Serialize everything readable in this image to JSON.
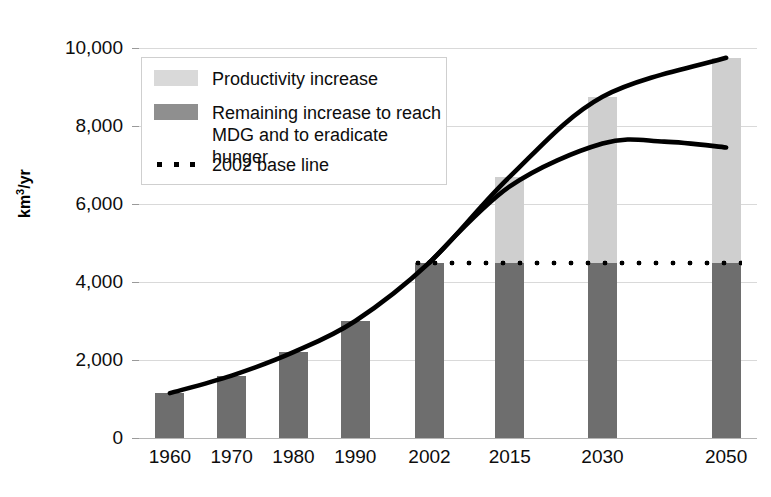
{
  "chart_data": {
    "type": "bar",
    "title": "",
    "subtitle": "",
    "xlabel": "",
    "ylabel": "km3/yr",
    "ylabel_display": "km",
    "ylabel_sup": "3",
    "ylabel_tail": "/yr",
    "categories": [
      "1960",
      "1970",
      "1980",
      "1990",
      "2002",
      "2015",
      "2030",
      "2050"
    ],
    "x_positions": [
      1960,
      1970,
      1980,
      1990,
      2002,
      2015,
      2030,
      2050
    ],
    "ylim": [
      0,
      10000
    ],
    "ytick_values": [
      0,
      2000,
      4000,
      6000,
      8000,
      10000
    ],
    "ytick_labels": [
      "0",
      "2,000",
      "4,000",
      "6,000",
      "8,000",
      "10,000"
    ],
    "grid": true,
    "legend_position": "top-left",
    "stacked": true,
    "series": [
      {
        "name": "Remaining increase to reach MDG and to eradicate hunger",
        "color": "#6e6e6e",
        "values": [
          1150,
          1600,
          2200,
          3000,
          4500,
          4500,
          4500,
          4500
        ]
      },
      {
        "name": "Productivity increase",
        "color": "#cfcfcf",
        "values": [
          0,
          0,
          0,
          0,
          0,
          2200,
          4250,
          5250
        ]
      }
    ],
    "bar_totals": [
      1150,
      1600,
      2200,
      3000,
      4500,
      6700,
      8750,
      9750
    ],
    "reference_line": {
      "name": "2002 base line",
      "value": 4500,
      "style": "dotted",
      "color": "#000000",
      "x_start": 2002,
      "x_end": 2050
    },
    "curves": [
      {
        "name": "upper-trend-curve",
        "color": "#000000",
        "points": [
          [
            1960,
            1150
          ],
          [
            1970,
            1600
          ],
          [
            1980,
            2200
          ],
          [
            1990,
            3000
          ],
          [
            2002,
            4500
          ],
          [
            2015,
            6700
          ],
          [
            2030,
            8750
          ],
          [
            2050,
            9750
          ]
        ]
      },
      {
        "name": "lower-trend-curve",
        "color": "#000000",
        "points": [
          [
            2002,
            4500
          ],
          [
            2015,
            6450
          ],
          [
            2030,
            7550
          ],
          [
            2040,
            7600
          ],
          [
            2050,
            7450
          ]
        ]
      }
    ]
  },
  "legend": {
    "items": [
      {
        "label": "Productivity increase",
        "swatch": "light"
      },
      {
        "label": "Remaining increase to reach\nMDG and to eradicate hunger",
        "swatch": "dark"
      },
      {
        "label": "2002 base line",
        "swatch": "dots"
      }
    ]
  }
}
